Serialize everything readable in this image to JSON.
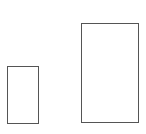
{
  "diagram": {
    "shapes": [
      {
        "type": "rectangle",
        "id": "small",
        "x": 7,
        "y": 66,
        "width": 32,
        "height": 58,
        "stroke": "#555555",
        "fill": "#ffffff"
      },
      {
        "type": "rectangle",
        "id": "large",
        "x": 81,
        "y": 23,
        "width": 58,
        "height": 100,
        "stroke": "#555555",
        "fill": "#ffffff"
      }
    ]
  }
}
